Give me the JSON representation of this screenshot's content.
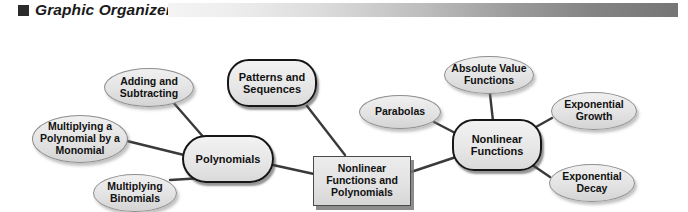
{
  "header": {
    "bullet_icon": "square-bullet-icon",
    "title": "Graphic Organizer",
    "bar_gradient_from": "#f4f4f4",
    "bar_gradient_to": "#767676"
  },
  "diagram": {
    "type": "concept-map",
    "center": {
      "id": "center",
      "label": "Nonlinear Functions and Polynomials",
      "shape": "rectangle",
      "x": 313,
      "y": 134,
      "w": 98,
      "h": 50
    },
    "hubs": [
      {
        "id": "polynomials",
        "label": "Polynomials",
        "shape": "rounded-oval",
        "x": 182,
        "y": 113,
        "w": 92,
        "h": 48
      },
      {
        "id": "nonlinear-functions",
        "label": "Nonlinear Functions",
        "shape": "rounded-rect",
        "x": 452,
        "y": 97,
        "w": 90,
        "h": 52
      }
    ],
    "nodes": [
      {
        "id": "adding-and-subtracting",
        "label": "Adding and Subtracting",
        "shape": "oval",
        "parent": "polynomials",
        "x": 104,
        "y": 46,
        "w": 90,
        "h": 39
      },
      {
        "id": "multiplying-a-polynomial-by-a-monomial",
        "label": "Multiplying a Polynomial by a Monomial",
        "shape": "oval",
        "parent": "polynomials",
        "x": 32,
        "y": 93,
        "w": 96,
        "h": 48
      },
      {
        "id": "multiplying-binomials",
        "label": "Multiplying Binomials",
        "shape": "oval",
        "parent": "polynomials",
        "x": 93,
        "y": 152,
        "w": 84,
        "h": 38
      },
      {
        "id": "patterns-and-sequences",
        "label": "Patterns and Sequences",
        "shape": "rounded-rect",
        "parent": "center",
        "x": 227,
        "y": 37,
        "w": 90,
        "h": 48
      },
      {
        "id": "parabolas",
        "label": "Parabolas",
        "shape": "oval",
        "parent": "nonlinear-functions",
        "x": 359,
        "y": 73,
        "w": 82,
        "h": 34
      },
      {
        "id": "absolute-value-functions",
        "label": "Absolute Value Functions",
        "shape": "oval",
        "parent": "nonlinear-functions",
        "x": 444,
        "y": 34,
        "w": 90,
        "h": 38
      },
      {
        "id": "exponential-growth",
        "label": "Exponential Growth",
        "shape": "oval",
        "parent": "nonlinear-functions",
        "x": 551,
        "y": 70,
        "w": 86,
        "h": 38
      },
      {
        "id": "exponential-decay",
        "label": "Exponential Decay",
        "shape": "oval",
        "parent": "nonlinear-functions",
        "x": 549,
        "y": 142,
        "w": 86,
        "h": 38
      }
    ],
    "edges": [
      {
        "from": "adding-and-subtracting",
        "to": "polynomials"
      },
      {
        "from": "multiplying-a-polynomial-by-a-monomial",
        "to": "polynomials"
      },
      {
        "from": "multiplying-binomials",
        "to": "polynomials"
      },
      {
        "from": "polynomials",
        "to": "center"
      },
      {
        "from": "patterns-and-sequences",
        "to": "center"
      },
      {
        "from": "center",
        "to": "nonlinear-functions"
      },
      {
        "from": "parabolas",
        "to": "nonlinear-functions"
      },
      {
        "from": "absolute-value-functions",
        "to": "nonlinear-functions"
      },
      {
        "from": "exponential-growth",
        "to": "nonlinear-functions"
      },
      {
        "from": "exponential-decay",
        "to": "nonlinear-functions"
      }
    ]
  }
}
